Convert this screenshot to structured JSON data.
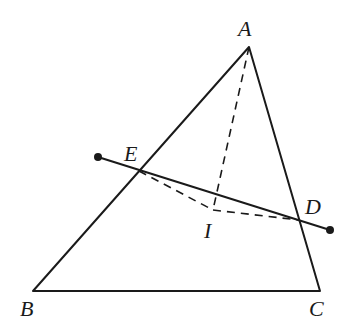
{
  "diagram": {
    "type": "geometry",
    "points": {
      "A": {
        "label": "A",
        "x": 249,
        "y": 47
      },
      "B": {
        "label": "B",
        "x": 33,
        "y": 291
      },
      "C": {
        "label": "C",
        "x": 320,
        "y": 291
      },
      "E": {
        "label": "E",
        "x": 139,
        "y": 171
      },
      "D": {
        "label": "D",
        "x": 299,
        "y": 220
      },
      "I": {
        "label": "I",
        "x": 213,
        "y": 210
      }
    },
    "segments_solid": [
      "AB",
      "BC",
      "CA"
    ],
    "segments_dashed": [
      "AI",
      "EI",
      "ID"
    ],
    "line_through_ED": {
      "start": [
        98,
        157
      ],
      "end": [
        330,
        230
      ],
      "endpoints": "filled-dots"
    },
    "stroke_color": "#1a1a1a"
  }
}
